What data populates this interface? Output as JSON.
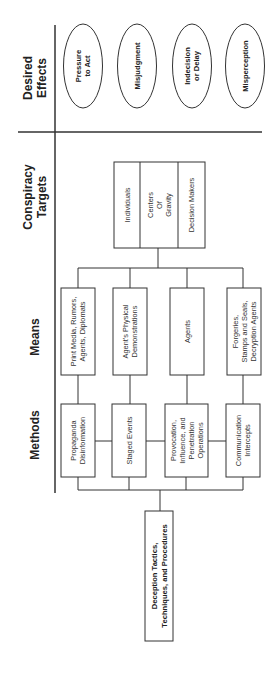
{
  "diagram": {
    "orientation": "rotated-90-ccw",
    "columns": {
      "effects": "Desired Effects",
      "targets": "Conspiracy Targets",
      "means": "Means",
      "methods": "Methods"
    },
    "column_header_lines": {
      "effects": [
        "Desired",
        "Effects"
      ],
      "targets": [
        "Conspiracy",
        "Targets"
      ],
      "means": [
        "Means"
      ],
      "methods": [
        "Methods"
      ]
    },
    "desired_effects": [
      {
        "lines": [
          "Pressure",
          "to Act"
        ]
      },
      {
        "lines": [
          "Misjudgment"
        ]
      },
      {
        "lines": [
          "Indecision",
          "or Delay"
        ]
      },
      {
        "lines": [
          "Misperception"
        ]
      }
    ],
    "targets": [
      {
        "lines": [
          "Individuals"
        ]
      },
      {
        "lines": [
          "Centers",
          "Of",
          "Gravity"
        ]
      },
      {
        "lines": [
          "Decision Makers"
        ]
      }
    ],
    "means": [
      {
        "lines": [
          "Print Media, Rumors,",
          "Agents, Diplomats"
        ]
      },
      {
        "lines": [
          "Agent's Physical",
          "Demonstrations"
        ]
      },
      {
        "lines": [
          "Agents"
        ]
      },
      {
        "lines": [
          "Forgeries,",
          "Stamps and Seals,",
          "Decryption Agents"
        ]
      }
    ],
    "methods": [
      {
        "lines": [
          "Propaganda",
          "Disinformation"
        ]
      },
      {
        "lines": [
          "Staged Events"
        ]
      },
      {
        "lines": [
          "Provocation,",
          "Influence, and",
          "Penetration",
          "Operations"
        ]
      },
      {
        "lines": [
          "Communication",
          "Intercepts"
        ]
      }
    ],
    "root": {
      "lines": [
        "Deception Tactics,",
        "Techniques, and Procedures"
      ]
    }
  }
}
